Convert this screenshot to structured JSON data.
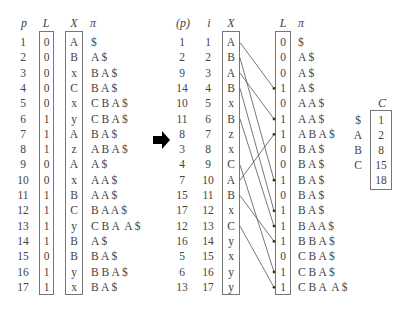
{
  "left_table": {
    "headers": {
      "p": "p",
      "L": "L",
      "X": "X",
      "pi": "π"
    },
    "rows": [
      {
        "p": "1",
        "L": "0",
        "X": "A",
        "pi": "$"
      },
      {
        "p": "2",
        "L": "0",
        "X": "B",
        "pi": "A $"
      },
      {
        "p": "3",
        "L": "0",
        "X": "x",
        "pi": "B A $"
      },
      {
        "p": "4",
        "L": "0",
        "X": "C",
        "pi": "B A $"
      },
      {
        "p": "5",
        "L": "0",
        "X": "x",
        "pi": "C B A $"
      },
      {
        "p": "6",
        "L": "1",
        "X": "y",
        "pi": "C B A $"
      },
      {
        "p": "7",
        "L": "1",
        "X": "A",
        "pi": "B A $"
      },
      {
        "p": "8",
        "L": "1",
        "X": "z",
        "pi": "A B A $"
      },
      {
        "p": "9",
        "L": "0",
        "X": "A",
        "pi": "A $"
      },
      {
        "p": "10",
        "L": "0",
        "X": "x",
        "pi": "A A $"
      },
      {
        "p": "11",
        "L": "1",
        "X": "B",
        "pi": "A A $"
      },
      {
        "p": "12",
        "L": "1",
        "X": "C",
        "pi": "B A A $"
      },
      {
        "p": "13",
        "L": "1",
        "X": "y",
        "pi": "C B A  A $"
      },
      {
        "p": "14",
        "L": "1",
        "X": "B",
        "pi": "A $"
      },
      {
        "p": "15",
        "L": "0",
        "X": "B",
        "pi": "B A $"
      },
      {
        "p": "16",
        "L": "1",
        "X": "y",
        "pi": "B B A $"
      },
      {
        "p": "17",
        "L": "1",
        "X": "x",
        "pi": "B A $"
      }
    ]
  },
  "arrow_icon": "right-arrow",
  "right_table": {
    "headers": {
      "p": "(p)",
      "i": "i",
      "X": "X",
      "L": "L",
      "pi": "π"
    },
    "rows": [
      {
        "p": "1",
        "i": "1",
        "X": "A",
        "L": "0",
        "pi": "$"
      },
      {
        "p": "2",
        "i": "2",
        "X": "B",
        "L": "0",
        "pi": "A $"
      },
      {
        "p": "9",
        "i": "3",
        "X": "A",
        "L": "0",
        "pi": "A $"
      },
      {
        "p": "14",
        "i": "4",
        "X": "B",
        "L": "1",
        "pi": "A $"
      },
      {
        "p": "10",
        "i": "5",
        "X": "x",
        "L": "0",
        "pi": "A A $"
      },
      {
        "p": "11",
        "i": "6",
        "X": "B",
        "L": "1",
        "pi": "A A $"
      },
      {
        "p": "8",
        "i": "7",
        "X": "z",
        "L": "1",
        "pi": "A B A $"
      },
      {
        "p": "3",
        "i": "8",
        "X": "x",
        "L": "0",
        "pi": "B A $"
      },
      {
        "p": "4",
        "i": "9",
        "X": "C",
        "L": "0",
        "pi": "B A $"
      },
      {
        "p": "7",
        "i": "10",
        "X": "A",
        "L": "1",
        "pi": "B A $"
      },
      {
        "p": "15",
        "i": "11",
        "X": "B",
        "L": "0",
        "pi": "B A $"
      },
      {
        "p": "17",
        "i": "12",
        "X": "x",
        "L": "1",
        "pi": "B A $"
      },
      {
        "p": "12",
        "i": "13",
        "X": "C",
        "L": "1",
        "pi": "B A A $"
      },
      {
        "p": "16",
        "i": "14",
        "X": "y",
        "L": "1",
        "pi": "B B A $"
      },
      {
        "p": "5",
        "i": "15",
        "X": "x",
        "L": "0",
        "pi": "C B A $"
      },
      {
        "p": "6",
        "i": "16",
        "X": "y",
        "L": "1",
        "pi": "C B A $"
      },
      {
        "p": "13",
        "i": "17",
        "X": "y",
        "L": "1",
        "pi": "C B A  A $"
      }
    ],
    "mappings": [
      {
        "from": 1,
        "to": 4
      },
      {
        "from": 2,
        "to": 10
      },
      {
        "from": 3,
        "to": 6
      },
      {
        "from": 4,
        "to": 12
      },
      {
        "from": 6,
        "to": 13
      },
      {
        "from": 9,
        "to": 16
      },
      {
        "from": 10,
        "to": 7
      },
      {
        "from": 11,
        "to": 14
      },
      {
        "from": 13,
        "to": 17
      }
    ]
  },
  "c_table": {
    "header": "C",
    "rows": [
      {
        "sym": "$",
        "val": "1"
      },
      {
        "sym": "A",
        "val": "2"
      },
      {
        "sym": "B",
        "val": "8"
      },
      {
        "sym": "C",
        "val": "15"
      },
      {
        "sym": "",
        "val": "18"
      }
    ]
  }
}
